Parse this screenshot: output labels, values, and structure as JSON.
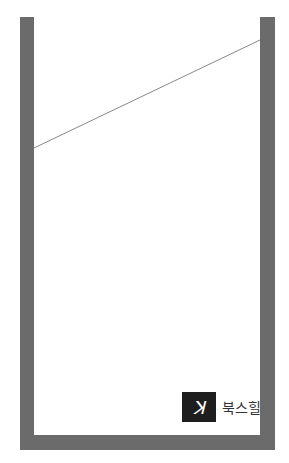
{
  "cover": {
    "top_text": "",
    "frame_color": "#6b6b6b",
    "line_color": "#888888",
    "line": {
      "x1": 34,
      "y1": 148,
      "x2": 260,
      "y2": 40
    }
  },
  "publisher": {
    "logo_mark": "북",
    "name": "북스힐"
  }
}
